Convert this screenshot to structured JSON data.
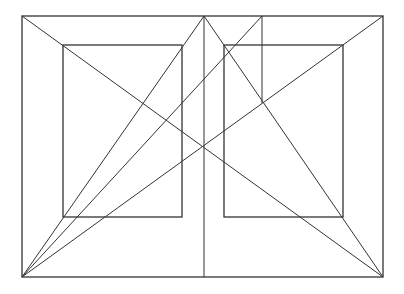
{
  "diagram": {
    "stroke": "#333333",
    "background": "#ffffff",
    "outer_rect": {
      "x": 22,
      "y": 16,
      "w": 361,
      "h": 261
    },
    "left_page": {
      "x": 63,
      "y": 45,
      "w": 119,
      "h": 172
    },
    "right_page": {
      "x": 224,
      "y": 45,
      "w": 119,
      "h": 172
    },
    "lines": [
      {
        "name": "diagonal-tl-br",
        "x1": 22,
        "y1": 16,
        "x2": 383,
        "y2": 277
      },
      {
        "name": "diagonal-bl-tr",
        "x1": 22,
        "y1": 277,
        "x2": 383,
        "y2": 16
      },
      {
        "name": "bl-to-spine-top",
        "x1": 22,
        "y1": 277,
        "x2": 204,
        "y2": 16
      },
      {
        "name": "spine-top-to-br",
        "x1": 204,
        "y1": 16,
        "x2": 383,
        "y2": 277
      },
      {
        "name": "spine",
        "x1": 204,
        "y1": 16,
        "x2": 204,
        "y2": 277
      },
      {
        "name": "bl-to-third-top",
        "x1": 22,
        "y1": 277,
        "x2": 262,
        "y2": 16
      },
      {
        "name": "third-vertical",
        "x1": 262,
        "y1": 16,
        "x2": 262,
        "y2": 103
      }
    ]
  }
}
